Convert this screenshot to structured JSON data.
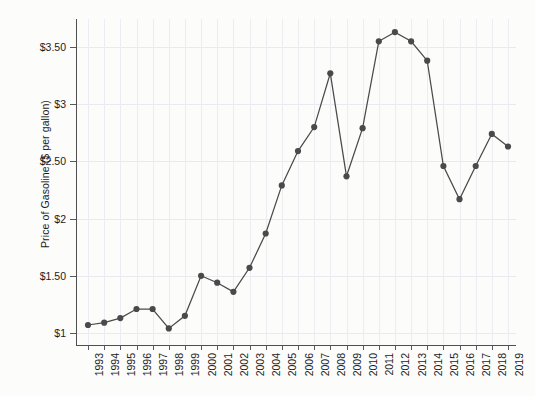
{
  "chart_data": {
    "type": "line",
    "title": "",
    "xlabel": "",
    "ylabel": "Price of Gasoline ($ per gallon)",
    "grid": true,
    "legend": "none",
    "marker": "filled-circle",
    "line_color": "#4a4a4a",
    "marker_color": "#4a4a4a",
    "xlim": [
      1993,
      2019
    ],
    "ylim": [
      0.95,
      3.78
    ],
    "y_ticks": [
      1,
      1.5,
      2,
      2.5,
      3,
      3.5
    ],
    "y_tick_labels": [
      "$1",
      "$1.50",
      "$2",
      "$2.50",
      "$3",
      "$3.50"
    ],
    "x_ticks": [
      1993,
      1994,
      1995,
      1996,
      1997,
      1998,
      1999,
      2000,
      2001,
      2002,
      2003,
      2004,
      2005,
      2006,
      2007,
      2008,
      2009,
      2010,
      2011,
      2012,
      2013,
      2014,
      2015,
      2016,
      2017,
      2018,
      2019
    ],
    "x_tick_labels": [
      "1993",
      "1994",
      "1995",
      "1996",
      "1997",
      "1998",
      "1999",
      "2000",
      "2001",
      "2002",
      "2003",
      "2004",
      "2005",
      "2006",
      "2007",
      "2008",
      "2009",
      "2010",
      "2011",
      "2012",
      "2013",
      "2014",
      "2015",
      "2016",
      "2017",
      "2018",
      "2019"
    ],
    "categories": [
      1993,
      1994,
      1995,
      1996,
      1997,
      1998,
      1999,
      2000,
      2001,
      2002,
      2003,
      2004,
      2005,
      2006,
      2007,
      2008,
      2009,
      2010,
      2011,
      2012,
      2013,
      2014,
      2015,
      2016,
      2017,
      2018,
      2019
    ],
    "values": [
      1.07,
      1.09,
      1.13,
      1.21,
      1.21,
      1.04,
      1.15,
      1.5,
      1.44,
      1.36,
      1.57,
      1.87,
      2.29,
      2.59,
      2.8,
      3.27,
      2.37,
      2.79,
      3.55,
      3.63,
      3.55,
      3.38,
      2.46,
      2.17,
      2.46,
      2.74,
      2.63
    ],
    "series": [
      {
        "name": "Price of Gasoline",
        "values": [
          1.07,
          1.09,
          1.13,
          1.21,
          1.21,
          1.04,
          1.15,
          1.5,
          1.44,
          1.36,
          1.57,
          1.87,
          2.29,
          2.59,
          2.8,
          3.27,
          2.37,
          2.79,
          3.55,
          3.63,
          3.55,
          3.38,
          2.46,
          2.17,
          2.46,
          2.74,
          2.63
        ]
      }
    ]
  }
}
